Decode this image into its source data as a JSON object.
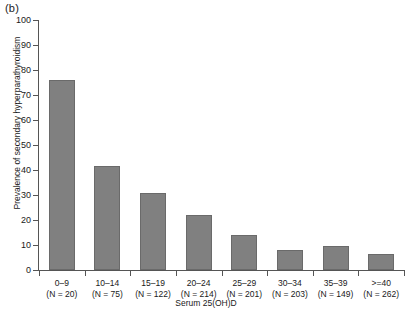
{
  "figure": {
    "panel_label": "(b)"
  },
  "chart_data": {
    "type": "bar",
    "title": "",
    "panel": "(b)",
    "xlabel": "Serum 25(OH)D",
    "ylabel": "Prevalence of secondary hyperparathyroidism",
    "ylim": [
      0,
      100
    ],
    "ytick_labels": [
      "0",
      "10",
      "20",
      "30",
      "40",
      "50",
      "60",
      "70",
      "80",
      "90",
      "100"
    ],
    "ytick_values": [
      0,
      10,
      20,
      30,
      40,
      50,
      60,
      70,
      80,
      90,
      100
    ],
    "grid": false,
    "legend": "none",
    "bar_color": "#808080",
    "bar_edge_color": "#6a6a6a",
    "axis_color": "#555555",
    "categories": [
      "0–9",
      "10–14",
      "15–19",
      "20–24",
      "25–29",
      "30–34",
      "35–39",
      ">=40"
    ],
    "category_counts": [
      "(N = 20)",
      "(N = 75)",
      "(N = 122)",
      "(N = 214)",
      "(N = 201)",
      "(N = 203)",
      "(N = 149)",
      "(N = 262)"
    ],
    "n_values": [
      20,
      75,
      122,
      214,
      201,
      203,
      149,
      262
    ],
    "values": [
      76,
      41.5,
      31,
      22,
      14,
      8,
      9.5,
      6.5
    ]
  }
}
